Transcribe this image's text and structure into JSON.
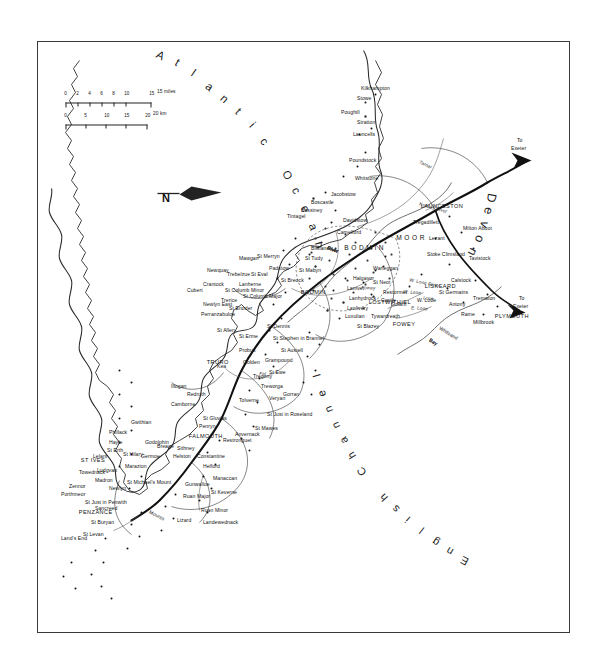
{
  "map": {
    "title": "Cornwall",
    "orientation_note": "map printed rotated 90 degrees clockwise on the page",
    "frame": {
      "x": 37,
      "y": 41,
      "w": 533,
      "h": 592
    }
  },
  "ocean_labels": [
    {
      "name": "atlantic-ocean-label",
      "text": "Atlantic Ocean"
    },
    {
      "name": "english-channel-label",
      "text": "English Channel"
    }
  ],
  "area_labels": [
    {
      "name": "devon-label",
      "text": "Devon"
    },
    {
      "name": "bodmin-moor-label",
      "text": "BODMIN"
    },
    {
      "name": "moor-label",
      "text": "MOOR"
    },
    {
      "name": "mounts-bay-label",
      "text": "Mounts"
    },
    {
      "name": "mounts-bay-label-2",
      "text": "Bay"
    },
    {
      "name": "whitsand-bay-label",
      "text": "Whitsand"
    },
    {
      "name": "whitsand-bay-label-2",
      "text": "Bay"
    }
  ],
  "roads": [
    {
      "name": "to-exeter-road-label",
      "text": "To"
    },
    {
      "name": "to-exeter-road-label-2",
      "text": "Exeter"
    },
    {
      "name": "to-exeter-road-label-b",
      "text": "To"
    },
    {
      "name": "to-exeter-road-label-b2",
      "text": "Exeter"
    }
  ],
  "rivers": [
    {
      "name": "river-tamar",
      "text": "Tamar"
    },
    {
      "name": "river-kensey",
      "text": "Kensey River"
    },
    {
      "name": "river-generic-1",
      "text": "River"
    },
    {
      "name": "river-camel",
      "text": "River"
    },
    {
      "name": "river-allen",
      "text": "River"
    },
    {
      "name": "river-fal",
      "text": "River"
    },
    {
      "name": "river-fal-2",
      "text": "Fal"
    },
    {
      "name": "river-e-looe",
      "text": "E. Looe"
    },
    {
      "name": "river-w-looe",
      "text": "W. Looe"
    },
    {
      "name": "river-w-looe-2",
      "text": "W. Looe  River"
    },
    {
      "name": "river-looe-river",
      "text": "River"
    },
    {
      "name": "river-fowey",
      "text": "Fowey"
    },
    {
      "name": "river-looe",
      "text": "Looe"
    }
  ],
  "major_towns": [
    {
      "name": "town-launceston",
      "text": "LAUNCESTON"
    },
    {
      "name": "town-liskeard",
      "text": "LISKEARD"
    },
    {
      "name": "town-plymouth",
      "text": "PLYMOUTH"
    },
    {
      "name": "town-lostwithiel",
      "text": "LOSTWITHIEL"
    },
    {
      "name": "town-fowey",
      "text": "FOWEY"
    },
    {
      "name": "town-bodmin",
      "text": "BODMIN"
    },
    {
      "name": "town-truro",
      "text": "TRURO"
    },
    {
      "name": "town-falmouth",
      "text": "FALMOUTH"
    },
    {
      "name": "town-st-ives",
      "text": "ST IVES"
    },
    {
      "name": "town-penzance",
      "text": "PENZANCE"
    }
  ],
  "places": [
    {
      "t": "Kilkhampton"
    },
    {
      "t": "Stowe"
    },
    {
      "t": "Poughill"
    },
    {
      "t": "Stratton"
    },
    {
      "t": "Launcells"
    },
    {
      "t": "Poundstock"
    },
    {
      "t": "Whitstone"
    },
    {
      "t": "Jacobstow"
    },
    {
      "t": "Boscastle"
    },
    {
      "t": "Bossiney"
    },
    {
      "t": "Tintagel"
    },
    {
      "t": "Davidstow"
    },
    {
      "t": "Camelford"
    },
    {
      "t": "Tregadillett"
    },
    {
      "t": "Lezant"
    },
    {
      "t": "Milton Abbot"
    },
    {
      "t": "Tavistock"
    },
    {
      "t": "Stoke Climsland"
    },
    {
      "t": "Calstock"
    },
    {
      "t": "Trematon"
    },
    {
      "t": "St Germains"
    },
    {
      "t": "Antony"
    },
    {
      "t": "Rame"
    },
    {
      "t": "Millbrook"
    },
    {
      "t": "W. Looe"
    },
    {
      "t": "Warleggan"
    },
    {
      "t": "St Neot"
    },
    {
      "t": "Restormel"
    },
    {
      "t": "Castle"
    },
    {
      "t": "Halgavor"
    },
    {
      "t": "Lanivet"
    },
    {
      "t": "Lanhydrock"
    },
    {
      "t": "Lanlivery"
    },
    {
      "t": "Luxulian"
    },
    {
      "t": "Golant"
    },
    {
      "t": "Tywardreath"
    },
    {
      "t": "St Blazey"
    },
    {
      "t": "Blisland"
    },
    {
      "t": "St Tudy"
    },
    {
      "t": "St Mabyn"
    },
    {
      "t": "St Breock"
    },
    {
      "t": "Padstow"
    },
    {
      "t": "St Merryn"
    },
    {
      "t": "St Eval"
    },
    {
      "t": "Mawgan"
    },
    {
      "t": "Lanherne"
    },
    {
      "t": "St Columb Major"
    },
    {
      "t": "Trebelzue"
    },
    {
      "t": "St Columb Minor"
    },
    {
      "t": "Trerice"
    },
    {
      "t": "St Enoder"
    },
    {
      "t": "Newquay"
    },
    {
      "t": "Crantock"
    },
    {
      "t": "Cubert"
    },
    {
      "t": "Newlyn East"
    },
    {
      "t": "Perranzabuloe"
    },
    {
      "t": "St Allen"
    },
    {
      "t": "St Erme"
    },
    {
      "t": "Probus"
    },
    {
      "t": "St Dennis"
    },
    {
      "t": "St Stephen in Brannel"
    },
    {
      "t": "St Austell"
    },
    {
      "t": "Grampound"
    },
    {
      "t": "St Ewe"
    },
    {
      "t": "Golden"
    },
    {
      "t": "Tregony"
    },
    {
      "t": "Treworga"
    },
    {
      "t": "Veryan"
    },
    {
      "t": "Gorran"
    },
    {
      "t": "St Just in Roseland"
    },
    {
      "t": "St Mawes"
    },
    {
      "t": "Tolverne"
    },
    {
      "t": "Kea"
    },
    {
      "t": "Anvernack"
    },
    {
      "t": "Restronguet"
    },
    {
      "t": "St Gluvias"
    },
    {
      "t": "Penryn"
    },
    {
      "t": "Redruth"
    },
    {
      "t": "Camborne"
    },
    {
      "t": "Illogan"
    },
    {
      "t": "Constantine"
    },
    {
      "t": "Helford"
    },
    {
      "t": "Manaccan"
    },
    {
      "t": "St Keverne"
    },
    {
      "t": "Gunwalloe"
    },
    {
      "t": "Ruan Major"
    },
    {
      "t": "Ruan Minor"
    },
    {
      "t": "Landewednack"
    },
    {
      "t": "Lizard"
    },
    {
      "t": "Helston"
    },
    {
      "t": "Sithney"
    },
    {
      "t": "Godolphin"
    },
    {
      "t": "Germoe"
    },
    {
      "t": "Breage"
    },
    {
      "t": "Marazion"
    },
    {
      "t": "St Hilary"
    },
    {
      "t": "St Michael's Mount"
    },
    {
      "t": "Newlyn"
    },
    {
      "t": "Madron"
    },
    {
      "t": "Ludgvan"
    },
    {
      "t": "St Erth"
    },
    {
      "t": "Hayle"
    },
    {
      "t": "Phillack"
    },
    {
      "t": "Lelant"
    },
    {
      "t": "Towednack"
    },
    {
      "t": "Zennor"
    },
    {
      "t": "Porthmeor"
    },
    {
      "t": "St Just in Penwith"
    },
    {
      "t": "Sancreed"
    },
    {
      "t": "St Buryan"
    },
    {
      "t": "St Levan"
    },
    {
      "t": "Land's End"
    },
    {
      "t": "Gwithian"
    }
  ],
  "scale": {
    "name": "scale-bar",
    "miles": {
      "unit": "15 miles",
      "ticks": [
        "0",
        "2",
        "4",
        "6",
        "8",
        "10",
        "15"
      ]
    },
    "km": {
      "unit": "20 km",
      "ticks": [
        "0",
        "5",
        "10",
        "15",
        "20"
      ]
    }
  },
  "compass": {
    "name": "compass-rose",
    "label": "N"
  },
  "colors": {
    "ink": "#111111",
    "frame": "#3a3a3a",
    "paper": "#ffffff",
    "water": "#555555"
  }
}
